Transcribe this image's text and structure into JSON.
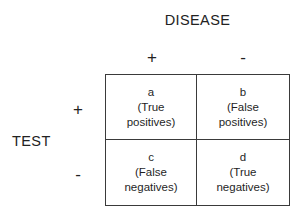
{
  "diagram": {
    "column_group_label": "DISEASE",
    "row_group_label": "TEST",
    "column_headers": [
      "+",
      "-"
    ],
    "row_headers": [
      "+",
      "-"
    ],
    "colors": {
      "background": "#ffffff",
      "border": "#3a3a3a",
      "text": "#1f1f1f"
    },
    "cells": [
      {
        "key": "a",
        "desc_line_1": "(True",
        "desc_line_2": "positives)",
        "full_label": "(True positives)"
      },
      {
        "key": "b",
        "desc_line_1": "(False",
        "desc_line_2": "positives)",
        "full_label": "(False positives)"
      },
      {
        "key": "c",
        "desc_line_1": "(False",
        "desc_line_2": "negatives)",
        "full_label": "(False negatives)"
      },
      {
        "key": "d",
        "desc_line_1": "(True",
        "desc_line_2": "negatives)",
        "full_label": "(True negatives)"
      }
    ]
  }
}
